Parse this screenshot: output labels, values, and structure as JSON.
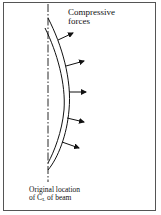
{
  "diagram": {
    "labels": {
      "forces_line1": "Compressive",
      "forces_line2": "forces",
      "original_line1": "Original location",
      "original_line2_prefix": "of C",
      "original_line2_sub": "L",
      "original_line2_suffix": " of beam"
    },
    "elements": {
      "centerline": "dash-dot vertical line (original centerline of beam)",
      "beam": "curved deflected beam (double line)",
      "arrows": [
        {
          "y": 35,
          "direction": "outward-right"
        },
        {
          "y": 62,
          "direction": "outward-right"
        },
        {
          "y": 92,
          "direction": "right"
        },
        {
          "y": 120,
          "direction": "outward-right"
        },
        {
          "y": 146,
          "direction": "outward-right"
        }
      ]
    },
    "colors": {
      "stroke": "#111111",
      "frame": "#555555",
      "background": "#ffffff"
    }
  }
}
